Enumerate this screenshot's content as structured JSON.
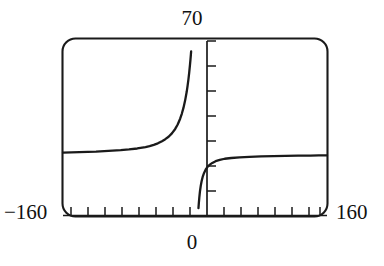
{
  "figure": {
    "title": "",
    "frame_color": "#1a1a1a",
    "curve_color": "#1a1a1a"
  },
  "labels": {
    "y_max": "70",
    "x_min": "−160",
    "x_max": "160",
    "x_origin": "0"
  },
  "chart_data": {
    "type": "line",
    "title": "",
    "subtitle": "",
    "xlabel": "",
    "ylabel": "",
    "xlim": [
      -160,
      160
    ],
    "ylim": [
      0,
      70
    ],
    "grid": false,
    "legend": null,
    "legend_position": "none",
    "x_tick_labels": [
      "−160",
      "0",
      "160"
    ],
    "y_tick_labels": [
      "70"
    ],
    "x_tick_step": 20,
    "y_tick_step": 10,
    "x_ticks": [
      -160,
      -140,
      -120,
      -100,
      -80,
      -60,
      -40,
      -20,
      0,
      20,
      40,
      60,
      80,
      100,
      120,
      140,
      160
    ],
    "y_ticks": [
      0,
      10,
      20,
      30,
      40,
      50,
      60,
      70
    ],
    "asymptotes": {
      "vertical": [
        0
      ],
      "horizontal_left": 24,
      "horizontal_right": 23
    },
    "series": [
      {
        "name": "left-branch",
        "x": [
          -160,
          -150,
          -140,
          -130,
          -120,
          -110,
          -100,
          -90,
          -80,
          -70,
          -60,
          -55,
          -50,
          -45,
          -40,
          -36,
          -32,
          -28,
          -24,
          -21,
          -18,
          -16,
          -14,
          -12,
          -10,
          -9,
          -8,
          -7,
          -6,
          -5.5,
          -5,
          -4.7
        ],
        "y": [
          24.3,
          24.4,
          24.5,
          24.6,
          24.7,
          24.9,
          25.1,
          25.3,
          25.6,
          26.0,
          26.6,
          27.0,
          27.5,
          28.1,
          29.0,
          29.8,
          30.8,
          32.2,
          34.0,
          35.8,
          38.2,
          40.2,
          42.6,
          45.6,
          49.3,
          51.6,
          54.2,
          57.2,
          60.5,
          62.4,
          64.4,
          65.7
        ]
      },
      {
        "name": "right-branch",
        "x": [
          4.2,
          4.6,
          5.2,
          6,
          7,
          8,
          9.5,
          11,
          13,
          15,
          18,
          21,
          25,
          30,
          36,
          44,
          54,
          66,
          80,
          95,
          110,
          125,
          140,
          150,
          160
        ],
        "y": [
          1.6,
          3.4,
          5.8,
          8.4,
          10.8,
          12.6,
          14.6,
          16.0,
          17.4,
          18.4,
          19.4,
          20.1,
          20.8,
          21.3,
          21.8,
          22.1,
          22.4,
          22.6,
          22.8,
          22.9,
          23.0,
          23.1,
          23.1,
          23.2,
          23.2
        ]
      }
    ]
  }
}
